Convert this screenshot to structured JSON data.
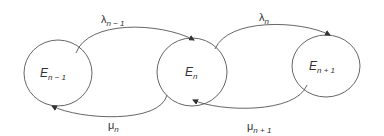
{
  "diagram": {
    "type": "birth-death state transition",
    "states": [
      {
        "id": "E_n-1",
        "base": "E",
        "sub": "n − 1"
      },
      {
        "id": "E_n",
        "base": "E",
        "sub": "n"
      },
      {
        "id": "E_n+1",
        "base": "E",
        "sub": "n + 1"
      }
    ],
    "edges": [
      {
        "from": "E_n-1",
        "to": "E_n",
        "base": "λ",
        "sub": "n − 1"
      },
      {
        "from": "E_n",
        "to": "E_n-1",
        "base": "μ",
        "sub": "n"
      },
      {
        "from": "E_n",
        "to": "E_n+1",
        "base": "λ",
        "sub": "n"
      },
      {
        "from": "E_n+1",
        "to": "E_n",
        "base": "μ",
        "sub": "n + 1"
      }
    ],
    "colors": {
      "stroke": "#444444",
      "text": "#333333",
      "background": "#ffffff"
    }
  }
}
